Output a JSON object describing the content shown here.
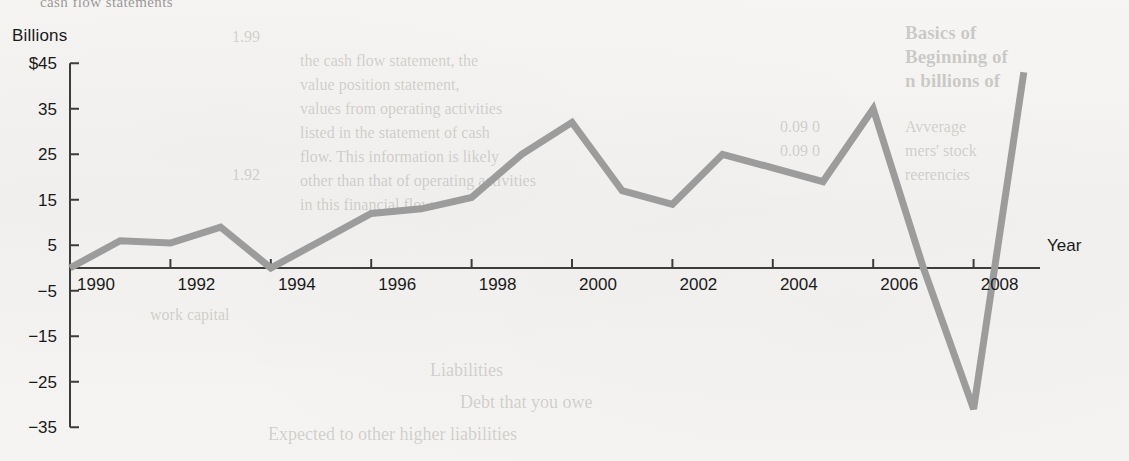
{
  "figure": {
    "y_axis_title": "Billions",
    "x_axis_title": "Year",
    "clipped_caption": "cash flow statements"
  },
  "chart_data": {
    "type": "line",
    "title": "",
    "subtitle": "",
    "xlabel": "Year",
    "ylabel": "Billions",
    "grid": false,
    "legend": "none",
    "line_color": "#9c9c9c",
    "axis_color": "#3c3c3c",
    "background_color": "#f4f3f1",
    "x": [
      1990,
      1991,
      1992,
      1993,
      1994,
      1995,
      1996,
      1997,
      1998,
      1999,
      2000,
      2001,
      2002,
      2003,
      2004,
      2005,
      2006,
      2007,
      2008,
      2009
    ],
    "values": [
      0,
      6,
      5.5,
      9,
      0,
      6,
      12,
      13,
      15.5,
      25,
      32,
      17,
      14,
      25,
      22,
      19,
      35,
      0,
      -31,
      43
    ],
    "series": [
      {
        "name": "Net cash flow",
        "values": [
          0,
          6,
          5.5,
          9,
          0,
          6,
          12,
          13,
          15.5,
          25,
          32,
          17,
          14,
          25,
          22,
          19,
          35,
          0,
          -31,
          43
        ]
      }
    ],
    "xlim": [
      1990,
      2009
    ],
    "ylim": [
      -35,
      45
    ],
    "y_ticks": [
      45,
      35,
      25,
      15,
      5,
      -5,
      -15,
      -25,
      -35
    ],
    "y_tick_labels": [
      "$45",
      "35",
      "25",
      "15",
      "5",
      "−5",
      "−15",
      "−25",
      "−35"
    ],
    "x_ticks": [
      1990,
      1992,
      1994,
      1996,
      1998,
      2000,
      2002,
      2004,
      2006,
      2008
    ],
    "x_tick_labels": [
      "1990",
      "1992",
      "1994",
      "1996",
      "1998",
      "2000",
      "2002",
      "2004",
      "2006",
      "2008"
    ]
  },
  "background_text": {
    "right_column": [
      "Basics of",
      "Beginning of",
      "n billions of"
    ],
    "right_rows": [
      "Avverage",
      "mers' stock",
      "reerencies"
    ],
    "center_lines": [
      "the cash flow statement, the",
      "value position statement,",
      "values from operating activities",
      "listed in the statement of cash",
      "flow. This information is likely",
      "other than that of operating activities",
      "in this financial flow"
    ],
    "lower_labels": [
      "Liabilities",
      "Debt that you owe",
      "Expected to other higher liabilities"
    ],
    "numbers": [
      "1.99",
      "0.09 0",
      "0.09 0",
      "1.92"
    ],
    "misc": [
      "work capital"
    ]
  }
}
